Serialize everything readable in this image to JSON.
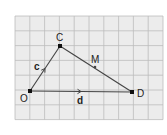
{
  "diagram": {
    "type": "vector-triangle-on-grid",
    "colors": {
      "background": "#ffffff",
      "grid_fill": "#ececec",
      "grid_line": "#bdbdbd",
      "stroke": "#444444",
      "point": "#111111"
    },
    "grid": {
      "x0": 15,
      "y0": 16,
      "cell": 14.8,
      "cols": 10,
      "rows": 7
    },
    "points": [
      {
        "id": "O",
        "label": "O",
        "x": 30,
        "y": 91,
        "label_x": 20,
        "label_y": 102
      },
      {
        "id": "C",
        "label": "C",
        "x": 60,
        "y": 46,
        "label_x": 56,
        "label_y": 41
      },
      {
        "id": "D",
        "label": "D",
        "x": 132,
        "y": 92,
        "label_x": 137,
        "label_y": 97
      },
      {
        "id": "M",
        "label": "M",
        "x": 95,
        "y": 67,
        "label_x": 91,
        "label_y": 63
      }
    ],
    "vectors": [
      {
        "id": "c",
        "label": "c",
        "from": "O",
        "to": "C",
        "label_x": 34,
        "label_y": 70
      },
      {
        "id": "d",
        "label": "d",
        "from": "O",
        "to": "D",
        "label_x": 77,
        "label_y": 104
      }
    ],
    "segments": [
      {
        "from": "C",
        "to": "D"
      }
    ]
  }
}
